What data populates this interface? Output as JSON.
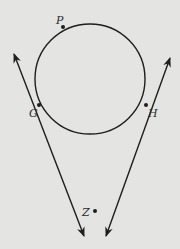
{
  "diagram": {
    "type": "geometry",
    "circle": {
      "label": "circle",
      "points_on_circle": [
        "P",
        "G",
        "H"
      ]
    },
    "points": [
      {
        "id": "P",
        "label": "P",
        "role": "point on circle"
      },
      {
        "id": "G",
        "label": "G",
        "role": "point of tangency"
      },
      {
        "id": "H",
        "label": "H",
        "role": "point of tangency"
      },
      {
        "id": "Z",
        "label": "Z",
        "role": "external point, intersection of tangent lines"
      }
    ],
    "lines": [
      {
        "id": "ZG",
        "name": "tangent line through G and Z",
        "arrows": "both ends"
      },
      {
        "id": "ZH",
        "name": "tangent line through H and Z",
        "arrows": "both ends"
      }
    ],
    "colors": {
      "background": "#e4e4e2",
      "ink": "#1e1e1e"
    }
  }
}
